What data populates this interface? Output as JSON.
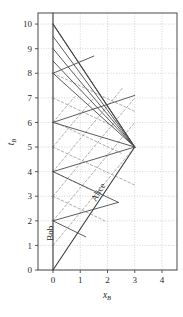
{
  "chart_data": {
    "type": "line",
    "title": "",
    "xlabel": "x_B",
    "ylabel": "t_B",
    "xlim": [
      -0.55,
      4.55
    ],
    "ylim": [
      0,
      10.45
    ],
    "xticks": [
      0,
      1,
      2,
      3,
      4
    ],
    "xticklabels": [
      "0",
      "1",
      "2",
      "3",
      "4"
    ],
    "yticks": [
      0,
      1,
      2,
      3,
      4,
      5,
      6,
      7,
      8,
      9,
      10
    ],
    "yticklabels": [
      "0",
      "1",
      "2",
      "3",
      "4",
      "5",
      "6",
      "7",
      "8",
      "9",
      "10"
    ],
    "grid": true,
    "grid_style": "dotted",
    "grid_color": "#b9b9b9",
    "frame_color": "#4a4a4a",
    "legend": "none",
    "annotations": [
      {
        "text": "Bob",
        "x": 0.0,
        "y": 1.5,
        "rotation": -90
      },
      {
        "text": "Alice",
        "x": 1.75,
        "y": 3.1,
        "rotation": -59
      }
    ],
    "series": [
      {
        "name": "bob-worldline",
        "style": "solid",
        "color": "#3c3c3c",
        "width": 1.1,
        "points": [
          [
            0,
            0
          ],
          [
            0,
            10.45
          ]
        ]
      },
      {
        "name": "alice-worldline-outbound",
        "style": "solid",
        "color": "#3c3c3c",
        "width": 1.1,
        "points": [
          [
            0,
            0
          ],
          [
            3,
            5
          ]
        ]
      },
      {
        "name": "alice-worldline-return",
        "style": "solid",
        "color": "#3c3c3c",
        "width": 1.1,
        "points": [
          [
            3,
            5
          ],
          [
            0,
            10
          ]
        ]
      },
      {
        "name": "light-signal-bob-t2",
        "style": "solid",
        "color": "#4a4a4a",
        "width": 0.9,
        "points": [
          [
            0,
            2
          ],
          [
            1.2,
            1.35
          ]
        ]
      },
      {
        "name": "light-signal-bob-t4",
        "style": "solid",
        "color": "#4a4a4a",
        "width": 0.9,
        "points": [
          [
            0,
            4
          ],
          [
            2.4,
            2.75
          ]
        ]
      },
      {
        "name": "light-signal-bob-t6",
        "style": "solid",
        "color": "#4a4a4a",
        "width": 0.9,
        "points": [
          [
            0,
            6
          ],
          [
            3,
            5
          ]
        ]
      },
      {
        "name": "light-signal-bob-t8",
        "style": "solid",
        "color": "#4a4a4a",
        "width": 0.9,
        "points": [
          [
            0,
            8
          ],
          [
            3,
            5
          ]
        ]
      },
      {
        "name": "light-signal-bob-t85",
        "style": "solid",
        "color": "#4a4a4a",
        "width": 0.9,
        "points": [
          [
            0,
            8.5
          ],
          [
            3,
            5
          ]
        ]
      },
      {
        "name": "light-signal-bob-t9",
        "style": "solid",
        "color": "#4a4a4a",
        "width": 0.9,
        "points": [
          [
            0,
            9
          ],
          [
            3,
            5
          ]
        ]
      },
      {
        "name": "light-signal-bob-t95",
        "style": "solid",
        "color": "#4a4a4a",
        "width": 0.9,
        "points": [
          [
            0,
            9.5
          ],
          [
            3,
            5
          ]
        ]
      },
      {
        "name": "light-signal-bob-t10",
        "style": "solid",
        "color": "#4a4a4a",
        "width": 0.9,
        "points": [
          [
            0,
            10
          ],
          [
            3,
            5
          ]
        ]
      },
      {
        "name": "light-signal-cross-a",
        "style": "solid",
        "color": "#4a4a4a",
        "width": 0.9,
        "points": [
          [
            0,
            2
          ],
          [
            2.4,
            2.75
          ]
        ]
      },
      {
        "name": "light-signal-cross-b",
        "style": "solid",
        "color": "#4a4a4a",
        "width": 0.9,
        "points": [
          [
            0,
            4
          ],
          [
            3,
            5
          ]
        ]
      },
      {
        "name": "light-signal-cross-c",
        "style": "solid",
        "color": "#4a4a4a",
        "width": 0.9,
        "points": [
          [
            0,
            6
          ],
          [
            3,
            7.1
          ]
        ]
      },
      {
        "name": "light-signal-cross-d",
        "style": "solid",
        "color": "#4a4a4a",
        "width": 0.9,
        "points": [
          [
            0,
            8
          ],
          [
            1.5,
            8.7
          ]
        ]
      },
      {
        "name": "dashed-line-1",
        "style": "dashed",
        "color": "#9a9a9a",
        "width": 0.8,
        "points": [
          [
            0,
            1
          ],
          [
            3,
            5
          ]
        ]
      },
      {
        "name": "dashed-line-2",
        "style": "dashed",
        "color": "#9a9a9a",
        "width": 0.8,
        "points": [
          [
            0,
            2
          ],
          [
            3,
            6
          ]
        ]
      },
      {
        "name": "dashed-line-3",
        "style": "dashed",
        "color": "#9a9a9a",
        "width": 0.8,
        "points": [
          [
            0,
            3
          ],
          [
            3,
            7
          ]
        ]
      },
      {
        "name": "dashed-line-4",
        "style": "dashed",
        "color": "#9a9a9a",
        "width": 0.8,
        "points": [
          [
            0,
            4
          ],
          [
            2.55,
            7.4
          ]
        ]
      },
      {
        "name": "dashed-line-5",
        "style": "dashed",
        "color": "#9a9a9a",
        "width": 0.8,
        "points": [
          [
            0,
            5
          ],
          [
            1.5,
            7.0
          ]
        ]
      },
      {
        "name": "dashed-line-6",
        "style": "dashed",
        "color": "#9a9a9a",
        "width": 0.8,
        "points": [
          [
            0,
            6
          ],
          [
            0.8,
            7.05
          ]
        ]
      },
      {
        "name": "dashed-line-7",
        "style": "dashed",
        "color": "#9a9a9a",
        "width": 0.8,
        "points": [
          [
            0,
            7
          ],
          [
            2.2,
            5.85
          ]
        ]
      },
      {
        "name": "dashed-line-8",
        "style": "dashed",
        "color": "#9a9a9a",
        "width": 0.8,
        "points": [
          [
            0,
            5
          ],
          [
            3,
            3.45
          ]
        ]
      },
      {
        "name": "dashed-line-9",
        "style": "dashed",
        "color": "#9a9a9a",
        "width": 0.8,
        "points": [
          [
            0,
            3
          ],
          [
            1.9,
            2.0
          ]
        ]
      },
      {
        "name": "dashed-line-10",
        "style": "dashed",
        "color": "#9a9a9a",
        "width": 0.8,
        "points": [
          [
            0,
            8
          ],
          [
            3,
            6.45
          ]
        ]
      },
      {
        "name": "dashed-line-11",
        "style": "dashed",
        "color": "#9a9a9a",
        "width": 0.8,
        "points": [
          [
            0,
            6.05
          ],
          [
            2.5,
            4.75
          ]
        ]
      },
      {
        "name": "dashed-line-12",
        "style": "dashed",
        "color": "#9a9a9a",
        "width": 0.8,
        "points": [
          [
            0,
            4.0
          ],
          [
            1.4,
            3.25
          ]
        ]
      }
    ]
  }
}
